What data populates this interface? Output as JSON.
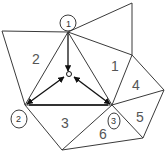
{
  "diagram": {
    "type": "triangulated mesh with vertex arrows to centroid",
    "colors": {
      "edge": "#3a3a3a",
      "arrow": "#111111",
      "label": "#555555"
    },
    "region_labels": [
      {
        "id": "r1",
        "text": "1"
      },
      {
        "id": "r2",
        "text": "2"
      },
      {
        "id": "r3",
        "text": "3"
      },
      {
        "id": "r4",
        "text": "4"
      },
      {
        "id": "r5",
        "text": "5"
      },
      {
        "id": "r6",
        "text": "6"
      }
    ],
    "vertex_circles": [
      {
        "id": "v1",
        "text": "1"
      },
      {
        "id": "v2",
        "text": "2"
      },
      {
        "id": "v3",
        "text": "3"
      }
    ]
  }
}
